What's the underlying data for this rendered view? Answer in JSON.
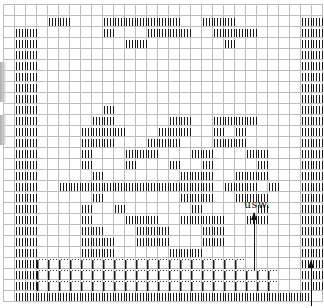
{
  "chart": {
    "cell_size": 11,
    "origin": {
      "x": 3,
      "y": 4
    },
    "cols": 29,
    "rows": 27,
    "legend": {
      "f": "full-stitch (vertical bars)",
      "d": "dotted stitch",
      ".": "empty"
    },
    "pattern": [
      ".............................",
      "....ff...fffffff..fff......ff",
      ".ff......f...ffff..ffff....ff",
      ".ff........ff.......f......ff",
      ".ff........................ff",
      ".ff........................ff",
      ".ff........................ff",
      ".ff........................ff",
      ".ff........................ff",
      ".ff......f.................ff",
      ".ff.....ff.....ff..ffff....ff",
      ".ff....ffff...fff..f.f.....ff",
      ".ff....fff...fff...fff.....ff",
      ".ff....f...fff...ff...ff...ff",
      ".ff....f...f...f..f....f...ff",
      ".ff.....f.......fff..fff...ff",
      ".ff..ffffffffffffff.fff.f..ff",
      ".ff.....f.......fff..fff...ff",
      ".ff....f..f......f.....f...ff",
      ".ff....f...fff..ffff..ff...ff",
      ".ff....ff...fff...ff.......ff",
      ".ff....fff..fff...ff.......ff",
      ".ff....fff.....fff.........ff",
      ".ffddddddddddddddddddd.....ff",
      ".ffdddddddddddddddddddddd..ff",
      ".ffdddddddddddddddddddddd..ff",
      ".fffffffffffffffffffffffffff."
    ]
  },
  "annotations": {
    "usw_label": "usw.",
    "usw_pos": {
      "x": 244,
      "y": 198
    },
    "arrows": [
      {
        "name": "usw-arrow",
        "x": 254,
        "top": 213,
        "bottom": 270
      },
      {
        "name": "row-direction-arrow",
        "x": 311,
        "top": 261,
        "bottom": 306
      }
    ]
  },
  "scan_shading": [
    {
      "top": 62,
      "height": 40
    },
    {
      "top": 115,
      "height": 30
    }
  ]
}
